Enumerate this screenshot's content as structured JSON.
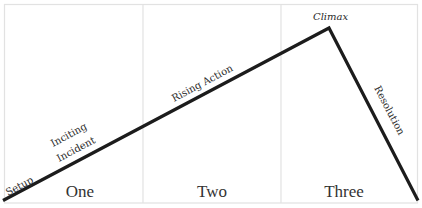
{
  "diagram": {
    "type": "story-arc",
    "colors": {
      "line": "#1c1c1c",
      "grid": "#e2e2e2",
      "text": "#2a2a2a",
      "background": "#ffffff"
    },
    "acts": [
      {
        "label": "One"
      },
      {
        "label": "Two"
      },
      {
        "label": "Three"
      }
    ],
    "stages": {
      "setup": "Setup",
      "inciting_line1": "Inciting",
      "inciting_line2": "Incident",
      "rising_action": "Rising Action",
      "climax": "Climax",
      "resolution": "Resolution"
    }
  }
}
